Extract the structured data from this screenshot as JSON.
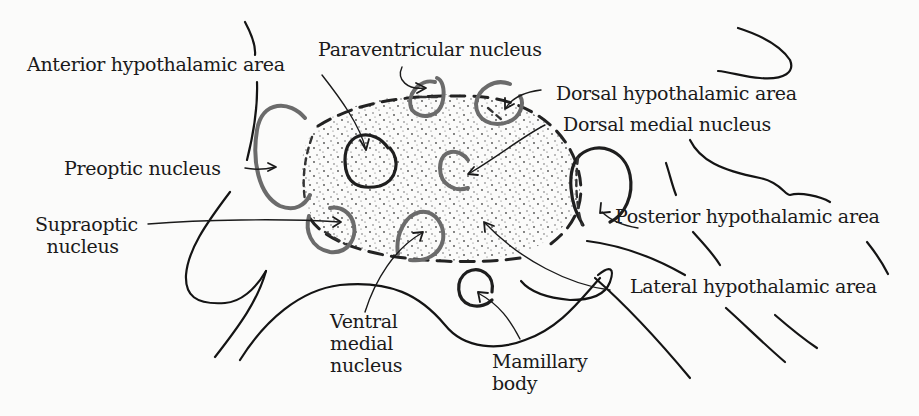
{
  "diagram": {
    "colors": {
      "background": "#fbfbfa",
      "ink": "#141414",
      "nucleus_gray": "#6b6b6b",
      "stipple": "#3a3a3a"
    },
    "labels": {
      "anterior_hypothalamic_area": "Anterior hypothalamic area",
      "paraventricular_nucleus": "Paraventricular nucleus",
      "dorsal_hypothalamic_area": "Dorsal hypothalamic area",
      "dorsal_medial_nucleus": "Dorsal medial nucleus",
      "preoptic_nucleus": "Preoptic nucleus",
      "supraoptic_nucleus": "Supraoptic\n  nucleus",
      "posterior_hypothalamic_area": "Posterior hypothalamic area",
      "lateral_hypothalamic_area": "Lateral hypothalamic area",
      "ventral_medial_nucleus": "Ventral\nmedial\nnucleus",
      "mamillary_body": "Mamillary\nbody"
    }
  }
}
